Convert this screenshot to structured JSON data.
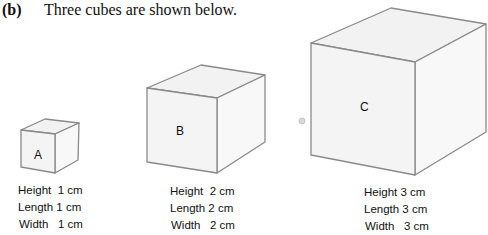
{
  "question": {
    "label": "(b)",
    "text": "Three cubes are shown below."
  },
  "cubes": [
    {
      "name": "A",
      "height": "Height  1 cm",
      "length": "Length 1 cm",
      "width": "Width   1 cm"
    },
    {
      "name": "B",
      "height": "Height  2 cm",
      "length": "Length 2 cm",
      "width": "Width   2 cm"
    },
    {
      "name": "C",
      "height": "Height 3 cm",
      "length": "Length 3 cm",
      "width": "Width   3 cm"
    }
  ],
  "colors": {
    "edge": "#8a8a8a",
    "face": "#f4f4f4"
  }
}
